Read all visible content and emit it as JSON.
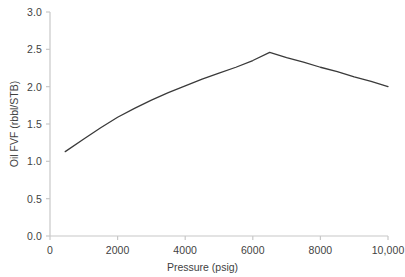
{
  "chart_data": {
    "type": "line",
    "title": "",
    "xlabel": "Pressure (psig)",
    "ylabel": "Oil FVF (rbbl/STB)",
    "xlim": [
      0,
      10000
    ],
    "ylim": [
      0.0,
      3.0
    ],
    "xticks": [
      0,
      2000,
      4000,
      6000,
      8000,
      10000
    ],
    "xtick_labels": [
      "0",
      "2000",
      "4000",
      "6000",
      "8000",
      "10,000"
    ],
    "yticks": [
      0.0,
      0.5,
      1.0,
      1.5,
      2.0,
      2.5,
      3.0
    ],
    "ytick_labels": [
      "0.0",
      "0.5",
      "1.0",
      "1.5",
      "2.0",
      "2.5",
      "3.0"
    ],
    "grid": false,
    "legend": "none",
    "line_color": "#3a3a3a",
    "axis_color": "#c8c8c8",
    "background_color": "#ffffff",
    "series": [
      {
        "name": "Oil FVF",
        "x": [
          450,
          1000,
          1500,
          2000,
          2500,
          3000,
          3500,
          4000,
          4500,
          5000,
          5500,
          6000,
          6500,
          7000,
          7500,
          8000,
          8500,
          9000,
          9500,
          10000
        ],
        "values": [
          1.13,
          1.3,
          1.45,
          1.59,
          1.71,
          1.82,
          1.92,
          2.01,
          2.1,
          2.18,
          2.26,
          2.35,
          2.46,
          2.39,
          2.33,
          2.26,
          2.2,
          2.13,
          2.07,
          2.0
        ]
      }
    ],
    "annotations": {
      "bubble_point_pressure": 6500,
      "bubble_point_fvf": 2.46
    }
  }
}
